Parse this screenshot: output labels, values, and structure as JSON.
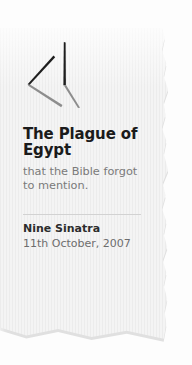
{
  "card": {
    "paper_color": "#f0f0f0",
    "background_color": "#fdfdfd",
    "edge_style": "torn-paper"
  },
  "logo": {
    "name": "abstract-quill-strokes-mark",
    "dark_stroke_color": "#1e1e1e",
    "light_stroke_color": "#8d8d8d"
  },
  "article": {
    "title": "The Plague of Egypt",
    "subtitle": "that the Bible forgot to mention.",
    "author": "Nine Sinatra",
    "date": "11th October, 2007",
    "title_color": "#1b1b1b",
    "subtitle_color": "#7a7a7a",
    "author_color": "#2c2c2c",
    "date_color": "#6d6d6d",
    "divider_color": "#d2d2d2"
  }
}
